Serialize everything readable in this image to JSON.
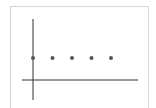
{
  "chart_data": {
    "type": "scatter",
    "title": "",
    "xlabel": "",
    "ylabel": "",
    "x": [
      0,
      1,
      2,
      3,
      4
    ],
    "y": [
      1,
      1,
      1,
      1,
      1
    ],
    "series": [
      {
        "name": "",
        "x": [
          0,
          1,
          2,
          3,
          4
        ],
        "y": [
          1,
          1,
          1,
          1,
          1
        ]
      }
    ],
    "grid": false,
    "legend": null,
    "point_color": "#555555",
    "axis_color": "#333333"
  }
}
